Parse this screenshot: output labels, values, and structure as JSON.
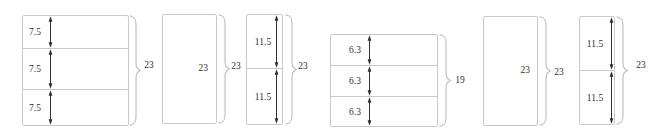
{
  "figure": {
    "colors": {
      "background": "#ffffff",
      "outline": "#c9c9c9",
      "brace": "#c2c2c2",
      "arrow": "#2f2f2f",
      "text": "#33302b"
    },
    "groups": [
      {
        "type": "stacked",
        "bands": [
          "7.5",
          "7.5",
          "7.5"
        ],
        "brace_label": "23"
      },
      {
        "type": "plain",
        "label": "23",
        "brace_label": "23"
      },
      {
        "type": "stacked",
        "bands": [
          "11.5",
          "11.5"
        ],
        "brace_label": "23"
      },
      {
        "type": "stacked",
        "bands": [
          "6.3",
          "6.3",
          "6.3"
        ],
        "brace_label": "19"
      },
      {
        "type": "plain",
        "label": "23",
        "brace_label": "23"
      },
      {
        "type": "stacked",
        "bands": [
          "11.5",
          "11.5"
        ],
        "brace_label": "23"
      }
    ]
  }
}
